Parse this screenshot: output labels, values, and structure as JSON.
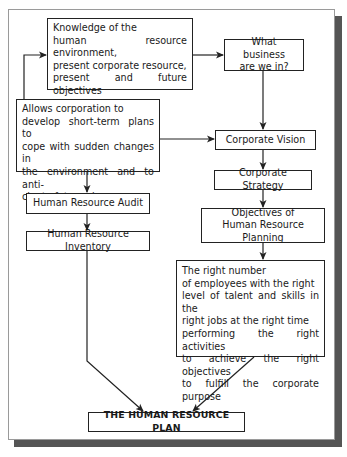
{
  "diagram": {
    "nodes": {
      "knowledge": {
        "title": "Knowledge of the",
        "lines": [
          "human resource environment,",
          "present corporate resource,",
          "present and future objectives",
          "of corporate planning"
        ]
      },
      "business": {
        "lines": [
          "What business",
          "are we in?"
        ]
      },
      "allows": {
        "title": "Allows corporation to",
        "lines": [
          "develop short-term plans to",
          "cope with sudden changes in",
          "the environment and to anti-",
          "cipate future change"
        ]
      },
      "vision": {
        "label": "Corporate Vision"
      },
      "strategy": {
        "label": "Corporate Strategy"
      },
      "objectives": {
        "lines": [
          "Objectives of",
          "Human Resource Planning"
        ]
      },
      "audit": {
        "label": "Human Resource Audit"
      },
      "inventory": {
        "label": "Human Resource Inventory"
      },
      "right_number": {
        "title": "The right number",
        "lines": [
          "of employees with the right",
          "level of talent and skills in the",
          "right jobs at the right time",
          "performing the right activities",
          "to achieve the right objectives",
          "to fulfill the corporate purpose"
        ]
      },
      "plan": {
        "label": "THE HUMAN RESOURCE PLAN"
      }
    },
    "edges": [
      {
        "from": "allows",
        "to": "knowledge"
      },
      {
        "from": "knowledge",
        "to": "business"
      },
      {
        "from": "business",
        "to": "vision"
      },
      {
        "from": "allows",
        "to": "vision"
      },
      {
        "from": "vision",
        "to": "strategy"
      },
      {
        "from": "strategy",
        "to": "objectives"
      },
      {
        "from": "objectives",
        "to": "right_number"
      },
      {
        "from": "allows",
        "to": "audit"
      },
      {
        "from": "audit",
        "to": "inventory"
      },
      {
        "from": "inventory",
        "to": "plan"
      },
      {
        "from": "right_number",
        "to": "plan"
      }
    ],
    "colors": {
      "line": "#222222",
      "shadow": "#555555",
      "frame": "#9a9a9a"
    }
  }
}
